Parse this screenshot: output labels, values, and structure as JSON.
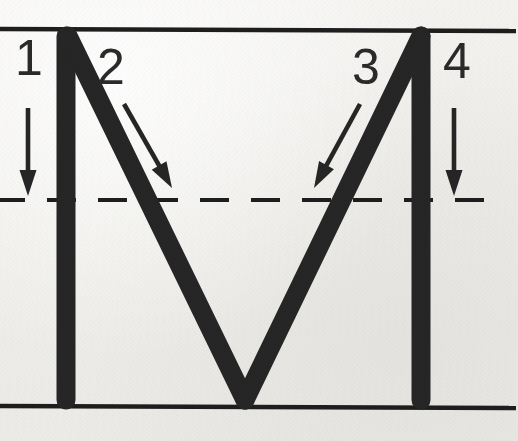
{
  "worksheet": {
    "title": "Letter M stroke-order handwriting guide",
    "letter": "M",
    "case": "uppercase",
    "background_color": "#f2f1ef",
    "ink_color": "#262626",
    "rule_color": "#1e1e1e"
  },
  "guide_lines": [
    {
      "name": "top-line",
      "style": "solid",
      "y": 29,
      "label": "top line"
    },
    {
      "name": "mid-line",
      "style": "dashed",
      "y": 200,
      "label": "dashed mid line"
    },
    {
      "name": "base-line",
      "style": "solid",
      "y": 406,
      "label": "base line"
    }
  ],
  "strokes": [
    {
      "number": "1",
      "name": "stroke-1-left-vertical",
      "description": "down",
      "direction": "down",
      "from": [
        66,
        36
      ],
      "to": [
        66,
        400
      ]
    },
    {
      "number": "2",
      "name": "stroke-2-down-right-diagonal",
      "description": "down-right diagonal",
      "direction": "down-right",
      "from": [
        68,
        36
      ],
      "to": [
        245,
        400
      ]
    },
    {
      "number": "3",
      "name": "stroke-3-up-right-diagonal",
      "description": "up-right diagonal",
      "direction": "up-right",
      "from": [
        245,
        400
      ],
      "to": [
        421,
        36
      ]
    },
    {
      "number": "4",
      "name": "stroke-4-right-vertical",
      "description": "down",
      "direction": "down",
      "from": [
        421,
        36
      ],
      "to": [
        421,
        400
      ]
    }
  ],
  "labels": [
    {
      "text": "1",
      "name": "stroke-label-1",
      "x": 15,
      "y": 33
    },
    {
      "text": "2",
      "name": "stroke-label-2",
      "x": 97,
      "y": 42
    },
    {
      "text": "3",
      "name": "stroke-label-3",
      "x": 352,
      "y": 42
    },
    {
      "text": "4",
      "name": "stroke-label-4",
      "x": 443,
      "y": 36
    }
  ],
  "arrows": [
    {
      "name": "stroke-arrow-1",
      "from": [
        28,
        108
      ],
      "to": [
        28,
        196
      ],
      "kind": "straight-down"
    },
    {
      "name": "stroke-arrow-2",
      "from": [
        124,
        104
      ],
      "to": [
        172,
        188
      ],
      "kind": "diagonal-down-right"
    },
    {
      "name": "stroke-arrow-3",
      "from": [
        360,
        104
      ],
      "to": [
        314,
        188
      ],
      "kind": "diagonal-down-left"
    },
    {
      "name": "stroke-arrow-4",
      "from": [
        454,
        108
      ],
      "to": [
        454,
        196
      ],
      "kind": "straight-down"
    }
  ]
}
